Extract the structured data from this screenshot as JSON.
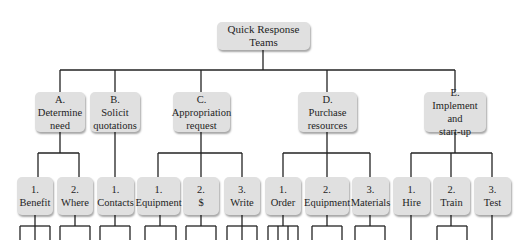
{
  "diagram": {
    "root": {
      "label": "Quick Response Teams"
    },
    "level1": [
      {
        "id": "A",
        "num": "A.",
        "label": "Determine\nneed"
      },
      {
        "id": "B",
        "num": "B.",
        "label": "Solicit\nquotations"
      },
      {
        "id": "C",
        "num": "C.",
        "label": "Appropriation\nrequest"
      },
      {
        "id": "D",
        "num": "D.",
        "label": "Purchase\nresources"
      },
      {
        "id": "E",
        "num": "E.",
        "label": "Implement and\nstart-up"
      }
    ],
    "level2": [
      {
        "parent": "A",
        "num": "1.",
        "label": "Benefit"
      },
      {
        "parent": "A",
        "num": "2.",
        "label": "Where"
      },
      {
        "parent": "B",
        "num": "1.",
        "label": "Contacts"
      },
      {
        "parent": "C",
        "num": "1.",
        "label": "Equipment"
      },
      {
        "parent": "C",
        "num": "2.",
        "label": "$"
      },
      {
        "parent": "C",
        "num": "3.",
        "label": "Write"
      },
      {
        "parent": "D",
        "num": "1.",
        "label": "Order"
      },
      {
        "parent": "D",
        "num": "2.",
        "label": "Equipment"
      },
      {
        "parent": "D",
        "num": "3.",
        "label": "Materials"
      },
      {
        "parent": "E",
        "num": "1.",
        "label": "Hire"
      },
      {
        "parent": "E",
        "num": "2.",
        "label": "Train"
      },
      {
        "parent": "E",
        "num": "3.",
        "label": "Test"
      }
    ]
  },
  "colors": {
    "box_fill": "#e0e0e0",
    "line": "#222222",
    "background": "#ffffff"
  }
}
